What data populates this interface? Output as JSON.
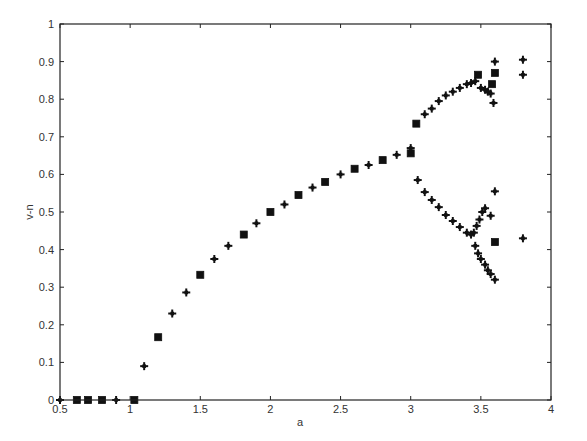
{
  "chart_data": {
    "type": "scatter",
    "title": "",
    "xlabel": "a",
    "ylabel": "v-n",
    "xlim": [
      0.5,
      4
    ],
    "ylim": [
      0,
      1
    ],
    "grid": false,
    "legend": null,
    "xticks": [
      0.5,
      1,
      1.5,
      2,
      2.5,
      3,
      3.5,
      4
    ],
    "xtick_labels": [
      "0.5",
      "1",
      "1.5",
      "2",
      "2.5",
      "3",
      "3.5",
      "4"
    ],
    "yticks": [
      0,
      0.1,
      0.2,
      0.3,
      0.4,
      0.5,
      0.6,
      0.7,
      0.8,
      0.9,
      1
    ],
    "ytick_labels": [
      "0",
      "0.1",
      "0.2",
      "0.3",
      "0.4",
      "0.5",
      "0.6",
      "0.7",
      "0.8",
      "0.9",
      "1"
    ],
    "marker_color": "#111111",
    "series": [
      {
        "name": "square markers",
        "marker": "square",
        "points": [
          [
            0.62,
            0.0
          ],
          [
            0.7,
            0.0
          ],
          [
            0.8,
            0.0
          ],
          [
            1.03,
            0.0
          ],
          [
            1.2,
            0.167
          ],
          [
            1.5,
            0.333
          ],
          [
            1.81,
            0.44
          ],
          [
            2.0,
            0.5
          ],
          [
            2.2,
            0.545
          ],
          [
            2.39,
            0.58
          ],
          [
            2.6,
            0.615
          ],
          [
            2.8,
            0.638
          ],
          [
            3.0,
            0.656
          ],
          [
            3.04,
            0.735
          ],
          [
            3.48,
            0.865
          ],
          [
            3.58,
            0.84
          ],
          [
            3.6,
            0.87
          ],
          [
            3.6,
            0.42
          ]
        ]
      },
      {
        "name": "plus markers",
        "marker": "plus",
        "points": [
          [
            0.5,
            0.0
          ],
          [
            0.9,
            0.0
          ],
          [
            1.1,
            0.09
          ],
          [
            1.3,
            0.23
          ],
          [
            1.4,
            0.286
          ],
          [
            1.6,
            0.375
          ],
          [
            1.7,
            0.41
          ],
          [
            1.9,
            0.47
          ],
          [
            2.1,
            0.52
          ],
          [
            2.3,
            0.565
          ],
          [
            2.5,
            0.6
          ],
          [
            2.7,
            0.625
          ],
          [
            2.9,
            0.652
          ],
          [
            3.0,
            0.67
          ],
          [
            3.1,
            0.76
          ],
          [
            3.15,
            0.775
          ],
          [
            3.2,
            0.795
          ],
          [
            3.25,
            0.81
          ],
          [
            3.3,
            0.82
          ],
          [
            3.35,
            0.83
          ],
          [
            3.4,
            0.84
          ],
          [
            3.43,
            0.843
          ],
          [
            3.46,
            0.848
          ],
          [
            3.5,
            0.83
          ],
          [
            3.53,
            0.825
          ],
          [
            3.55,
            0.82
          ],
          [
            3.57,
            0.815
          ],
          [
            3.59,
            0.79
          ],
          [
            3.6,
            0.9
          ],
          [
            3.05,
            0.585
          ],
          [
            3.1,
            0.553
          ],
          [
            3.15,
            0.532
          ],
          [
            3.2,
            0.513
          ],
          [
            3.25,
            0.492
          ],
          [
            3.3,
            0.476
          ],
          [
            3.35,
            0.46
          ],
          [
            3.4,
            0.445
          ],
          [
            3.43,
            0.44
          ],
          [
            3.45,
            0.445
          ],
          [
            3.47,
            0.463
          ],
          [
            3.49,
            0.48
          ],
          [
            3.51,
            0.5
          ],
          [
            3.53,
            0.51
          ],
          [
            3.57,
            0.49
          ],
          [
            3.6,
            0.555
          ],
          [
            3.46,
            0.41
          ],
          [
            3.48,
            0.39
          ],
          [
            3.5,
            0.375
          ],
          [
            3.53,
            0.36
          ],
          [
            3.55,
            0.345
          ],
          [
            3.57,
            0.335
          ],
          [
            3.6,
            0.32
          ],
          [
            3.8,
            0.905
          ],
          [
            3.8,
            0.865
          ],
          [
            3.8,
            0.43
          ]
        ]
      }
    ]
  }
}
